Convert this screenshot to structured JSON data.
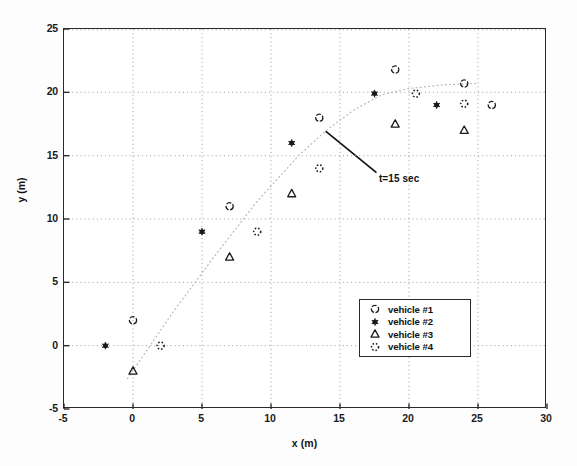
{
  "figure": {
    "background_color": "#fdfdfd",
    "axis_color": "#2b2b2b",
    "grid_color": "#9a9a9a",
    "marker_color": "#1a1a1a",
    "trajectory_color": "#b9b9b9"
  },
  "chart_data": {
    "type": "scatter",
    "title": "",
    "xlabel": "x (m)",
    "ylabel": "y (m)",
    "xlim": [
      -5,
      30
    ],
    "ylim": [
      -5,
      25
    ],
    "xticks": [
      -5,
      0,
      5,
      10,
      15,
      20,
      25,
      30
    ],
    "yticks": [
      -5,
      0,
      5,
      10,
      15,
      20,
      25
    ],
    "xtick_labels": [
      "-5",
      "0",
      "5",
      "10",
      "15",
      "20",
      "25",
      "30"
    ],
    "ytick_labels": [
      "-5",
      "0",
      "5",
      "10",
      "15",
      "20",
      "25"
    ],
    "grid": true,
    "grid_style": "dotted",
    "legend_position": "lower right",
    "series": [
      {
        "name": "vehicle #1",
        "marker": "circle-open",
        "points": [
          {
            "x": 0,
            "y": 2
          },
          {
            "x": 7,
            "y": 11
          },
          {
            "x": 13.5,
            "y": 18
          },
          {
            "x": 19,
            "y": 21.8
          },
          {
            "x": 24,
            "y": 20.7
          },
          {
            "x": 26,
            "y": 19
          }
        ]
      },
      {
        "name": "vehicle #2",
        "marker": "star-filled",
        "points": [
          {
            "x": -2,
            "y": 0
          },
          {
            "x": 5,
            "y": 9
          },
          {
            "x": 11.5,
            "y": 16
          },
          {
            "x": 17.5,
            "y": 19.9
          },
          {
            "x": 22,
            "y": 19
          }
        ]
      },
      {
        "name": "vehicle #3",
        "marker": "triangle-open",
        "points": [
          {
            "x": 0,
            "y": -2
          },
          {
            "x": 7,
            "y": 7
          },
          {
            "x": 11.5,
            "y": 12
          },
          {
            "x": 19,
            "y": 17.5
          },
          {
            "x": 24,
            "y": 17
          }
        ]
      },
      {
        "name": "vehicle #4",
        "marker": "circle-dotted",
        "points": [
          {
            "x": 2,
            "y": 0
          },
          {
            "x": 9,
            "y": 9
          },
          {
            "x": 13.5,
            "y": 14
          },
          {
            "x": 20.5,
            "y": 19.9
          },
          {
            "x": 24,
            "y": 19.1
          }
        ]
      }
    ],
    "trajectory": {
      "name": "reference path",
      "style": "dotted",
      "points": [
        {
          "x": -0.4,
          "y": -2.6
        },
        {
          "x": 3,
          "y": 2.8
        },
        {
          "x": 6,
          "y": 7.2
        },
        {
          "x": 9,
          "y": 11.4
        },
        {
          "x": 12,
          "y": 15.0
        },
        {
          "x": 14,
          "y": 17.0
        },
        {
          "x": 16,
          "y": 18.6
        },
        {
          "x": 18,
          "y": 19.8
        },
        {
          "x": 20,
          "y": 20.3
        },
        {
          "x": 22.5,
          "y": 20.6
        },
        {
          "x": 25,
          "y": 20.7
        }
      ]
    },
    "annotations": [
      {
        "text": "t=15 sec",
        "point": {
          "x": 14.0,
          "y": 16.9
        },
        "label_at": {
          "x": 17.6,
          "y": 13.7
        }
      }
    ]
  },
  "legend": {
    "entries": [
      {
        "label": "vehicle #1",
        "marker": "circle-open"
      },
      {
        "label": "vehicle #2",
        "marker": "star-filled"
      },
      {
        "label": "vehicle #3",
        "marker": "triangle-open"
      },
      {
        "label": "vehicle #4",
        "marker": "circle-dotted"
      }
    ]
  }
}
